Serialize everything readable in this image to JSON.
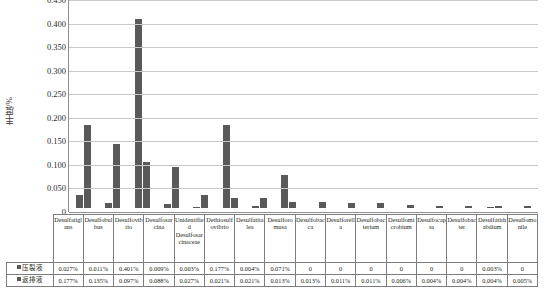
{
  "chart_data": {
    "type": "bar",
    "title": "",
    "xlabel": "",
    "ylabel": "丰度/%",
    "ylim": [
      0,
      0.45
    ],
    "ytick_labels": [
      "0.450",
      "0.400",
      "0.350",
      "0.300",
      "0.250",
      "0.200",
      "0.150",
      "0.100",
      "0.050",
      "0"
    ],
    "ytick_values": [
      0.45,
      0.4,
      0.35,
      0.3,
      0.25,
      0.2,
      0.15,
      0.1,
      0.05,
      0
    ],
    "grid": true,
    "legend_position": "table-row-headers",
    "categories": [
      "Desulfatiglans",
      "Desulfobulbus",
      "Desulfovibrio",
      "Desulfosarcina",
      "Unidentified Desulfosarcinaceae",
      "Dethiosulfovibrio",
      "Desulfatitalea",
      "Desulforomusa",
      "Desulfobacca",
      "Desulforella",
      "Desulfobacterium",
      "Desulfomicrobium",
      "Desulfocapsa",
      "Desulfobacter",
      "Desulfatirhabdium",
      "Desulfomonile"
    ],
    "series": [
      {
        "name": "压裂液",
        "values": [
          0.027,
          0.011,
          0.401,
          0.009,
          0.003,
          0.177,
          0.004,
          0.071,
          0,
          0,
          0,
          0,
          0,
          0,
          0.003,
          0
        ],
        "labels": [
          "0.027%",
          "0.011%",
          "0.401%",
          "0.009%",
          "0.003%",
          "0.177%",
          "0.004%",
          "0.071%",
          "0",
          "0",
          "0",
          "0",
          "0",
          "0",
          "0.003%",
          "0"
        ],
        "color": "#595959"
      },
      {
        "name": "返排液",
        "values": [
          0.177,
          0.135,
          0.097,
          0.088,
          0.027,
          0.021,
          0.021,
          0.013,
          0.013,
          0.011,
          0.011,
          0.006,
          0.004,
          0.004,
          0.004,
          0.005
        ],
        "labels": [
          "0.177%",
          "0.135%",
          "0.097%",
          "0.088%",
          "0.027%",
          "0.021%",
          "0.021%",
          "0.013%",
          "0.013%",
          "0.011%",
          "0.011%",
          "0.006%",
          "0.004%",
          "0.004%",
          "0.004%",
          "0.005%"
        ],
        "color": "#595959"
      }
    ]
  }
}
